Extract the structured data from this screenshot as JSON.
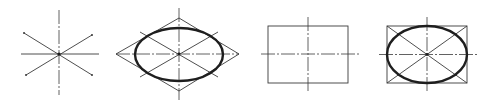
{
  "diagram": {
    "description": "Four-step construction of an isometric ellipse / ellipse in a rectangle",
    "colors": {
      "background": "#ffffff",
      "thin_line": "#3a3a3a",
      "thick_line": "#1e1e1e"
    },
    "figures": [
      {
        "id": "axes-star",
        "name": "Axes with diagonals",
        "center": [
          59,
          54
        ],
        "vertical": [
          [
            59,
            10
          ],
          [
            59,
            95
          ]
        ],
        "horizontal": [
          [
            21,
            54
          ],
          [
            99,
            54
          ]
        ],
        "diagonals": [
          [
            [
              24,
              33
            ],
            [
              92,
              75
            ]
          ],
          [
            [
              92,
              35
            ],
            [
              26,
              75
            ]
          ]
        ]
      },
      {
        "id": "rhombus-ellipse",
        "name": "Ellipse inscribed in rhombus",
        "center": [
          179,
          54
        ],
        "rhombus": [
          [
            116,
            54
          ],
          [
            179,
            18
          ],
          [
            239,
            54
          ],
          [
            179,
            91
          ]
        ],
        "ellipse": {
          "cx": 179,
          "cy": 54.5,
          "rx": 44,
          "ry": 26.5
        },
        "vertical": [
          [
            179,
            8
          ],
          [
            179,
            100
          ]
        ],
        "horizontal": [
          [
            116,
            54
          ],
          [
            239,
            54
          ]
        ],
        "diagonals": [
          [
            [
              140,
              32
            ],
            [
              218,
              77
            ]
          ],
          [
            [
              218,
              32
            ],
            [
              140,
              77
            ]
          ]
        ]
      },
      {
        "id": "rectangle-axes",
        "name": "Rectangle with center lines",
        "center": [
          308,
          54
        ],
        "rect": {
          "x": 268,
          "y": 26,
          "w": 80,
          "h": 57
        },
        "vertical": [
          [
            308,
            17
          ],
          [
            308,
            92
          ]
        ],
        "horizontal": [
          [
            261,
            54
          ],
          [
            360,
            54
          ]
        ]
      },
      {
        "id": "rectangle-ellipse",
        "name": "Ellipse inscribed in rectangle with diagonals",
        "center": [
          427,
          54.5
        ],
        "rect": {
          "x": 387,
          "y": 26,
          "w": 80,
          "h": 57
        },
        "ellipse": {
          "cx": 427,
          "cy": 54.5,
          "rx": 40,
          "ry": 28.5
        },
        "vertical": [
          [
            427,
            17
          ],
          [
            427,
            92
          ]
        ],
        "horizontal": [
          [
            379,
            54.5
          ],
          [
            478,
            54.5
          ]
        ],
        "diagonals": [
          [
            [
              387,
              26
            ],
            [
              467,
              83
            ]
          ],
          [
            [
              467,
              26
            ],
            [
              387,
              83
            ]
          ]
        ]
      }
    ]
  }
}
